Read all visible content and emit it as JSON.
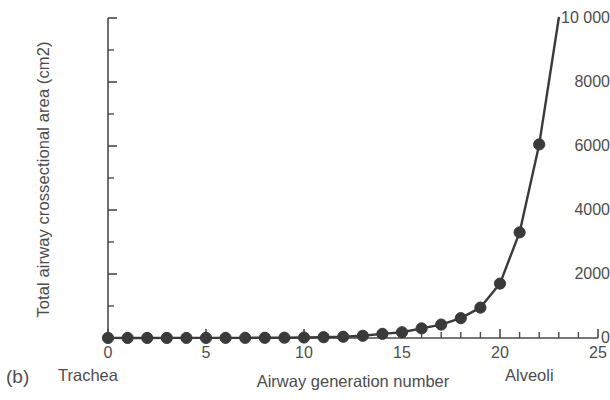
{
  "figure": {
    "panel_label": "(b)"
  },
  "chart_data": {
    "type": "line",
    "title": "",
    "xlabel": "Airway generation number",
    "ylabel": "Total airway crossectional area (cm2)",
    "xlim": [
      0,
      25
    ],
    "ylim": [
      0,
      10000
    ],
    "grid": false,
    "legend": null,
    "x_major_ticks": [
      0,
      5,
      10,
      15,
      20,
      25
    ],
    "x_major_tick_labels": [
      "0",
      "5",
      "10",
      "15",
      "20",
      "25"
    ],
    "x_minor_tick_step": 1,
    "y_major_ticks": [
      0,
      2000,
      4000,
      6000,
      8000,
      10000
    ],
    "y_major_tick_labels": [
      "0",
      "2000",
      "4000",
      "6000",
      "8000",
      "10 000"
    ],
    "y_minor_ticks": [
      1000,
      3000,
      5000,
      7000,
      9000
    ],
    "annotations": [
      {
        "text": "Trachea",
        "x": 0,
        "position": "below-axis-left"
      },
      {
        "text": "Alveoli",
        "x": 23,
        "position": "below-axis-right"
      }
    ],
    "series": [
      {
        "name": "Total airway crossectional area",
        "marker": "circle",
        "color": "#3a3a3a",
        "x": [
          0,
          1,
          2,
          3,
          4,
          5,
          6,
          7,
          8,
          9,
          10,
          11,
          12,
          13,
          14,
          15,
          16,
          17,
          18,
          19,
          20,
          21,
          22
        ],
        "values": [
          2.5,
          2.3,
          2.2,
          2.4,
          2.8,
          3.2,
          3.9,
          5.1,
          7.0,
          10,
          15,
          25,
          40,
          70,
          130,
          180,
          300,
          420,
          620,
          950,
          1700,
          3300,
          6050
        ],
        "extrapolation": {
          "note": "line continues beyond last marker off the top of the plot",
          "x_end": 23,
          "y_end": 10000
        }
      }
    ]
  }
}
